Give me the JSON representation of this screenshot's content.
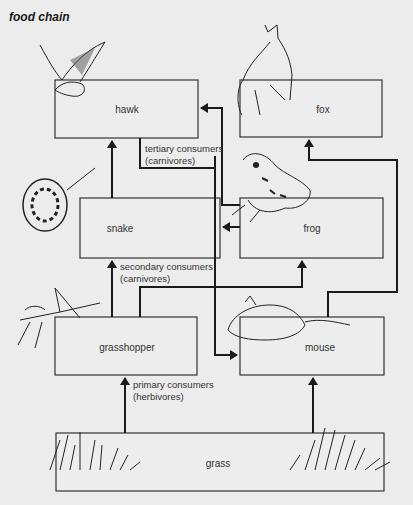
{
  "title": "food chain",
  "nodes": {
    "hawk": "hawk",
    "fox": "fox",
    "snake": "snake",
    "frog": "frog",
    "grasshopper": "grasshopper",
    "mouse": "mouse",
    "grass": "grass"
  },
  "levels": {
    "tertiary_line1": "tertiary consumers",
    "tertiary_line2": "(carnivores)",
    "secondary_line1": "secondary consumers",
    "secondary_line2": "(carnivores)",
    "primary_line1": "primary consumers",
    "primary_line2": "(herbivores)"
  },
  "edges": [
    {
      "from": "grass",
      "to": "grasshopper"
    },
    {
      "from": "grass",
      "to": "mouse"
    },
    {
      "from": "grasshopper",
      "to": "snake"
    },
    {
      "from": "grasshopper",
      "to": "frog"
    },
    {
      "from": "mouse",
      "to": "snake"
    },
    {
      "from": "mouse",
      "to": "hawk"
    },
    {
      "from": "frog",
      "to": "snake"
    },
    {
      "from": "frog",
      "to": "hawk"
    },
    {
      "from": "snake",
      "to": "hawk"
    },
    {
      "from": "mouse",
      "to": "fox"
    }
  ]
}
